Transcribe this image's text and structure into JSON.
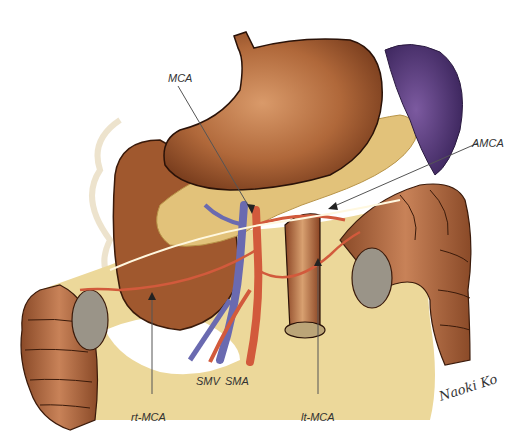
{
  "figure": {
    "type": "anatomical-illustration",
    "colors": {
      "stomach": "#b0683a",
      "stomach_dark": "#7a3e1e",
      "spleen": "#5a3d7a",
      "pancreas": "#e2c27a",
      "mesentery": "#ecd89a",
      "colon": "#a8643a",
      "artery": "#d25a3c",
      "vein": "#6a6ab0",
      "leader_line": "#555555"
    },
    "labels": {
      "mca": "MCA",
      "amca": "AMCA",
      "smv": "SMV",
      "sma": "SMA",
      "rt_mca": "rt-MCA",
      "lt_mca": "lt-MCA"
    },
    "signature": "Naoki Ko"
  }
}
